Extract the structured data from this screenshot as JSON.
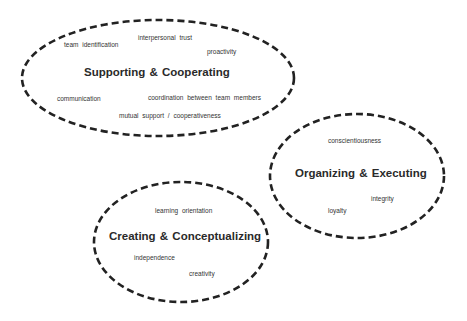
{
  "diagram": {
    "type": "clustered-ellipses",
    "stroke_color": "#222222",
    "clusters": [
      {
        "title": "Supporting & Cooperating",
        "items": [
          "team identification",
          "interpersonal trust",
          "proactivity",
          "communication",
          "coordination between team members",
          "mutual support / cooperativeness"
        ]
      },
      {
        "title": "Organizing & Executing",
        "items": [
          "conscientiousness",
          "integrity",
          "loyalty"
        ]
      },
      {
        "title": "Creating & Conceptualizing",
        "items": [
          "learning orientation",
          "independence",
          "creativity"
        ]
      }
    ]
  }
}
